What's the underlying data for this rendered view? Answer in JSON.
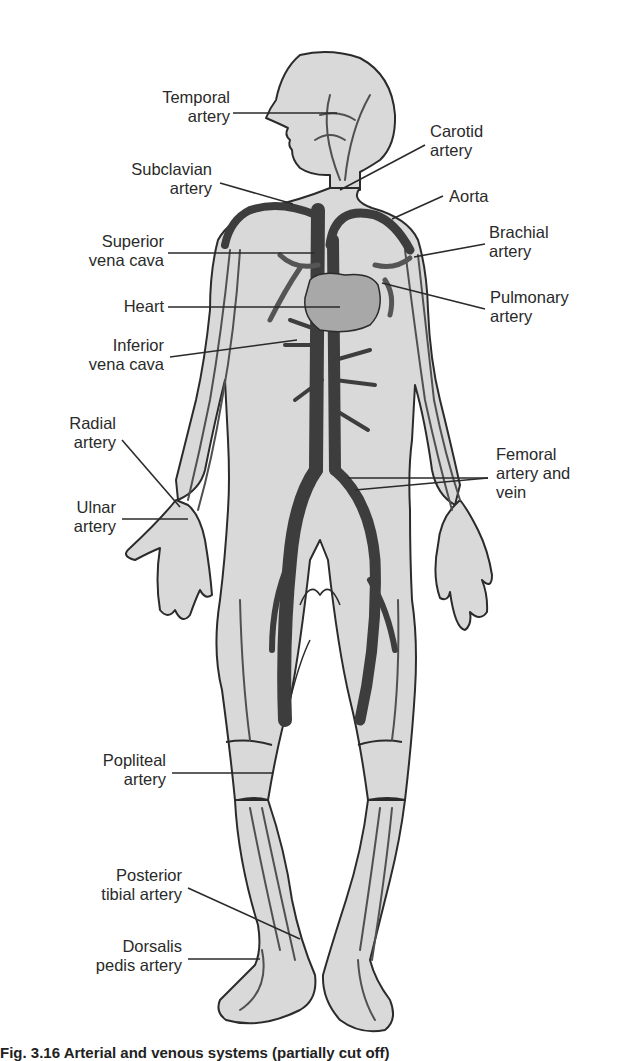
{
  "figure": {
    "colors": {
      "background": "#ffffff",
      "body_fill": "#d9d9d9",
      "outline": "#2b2b2b",
      "vessel_dark": "#3d3d3d",
      "vessel_mid": "#5a5a5a",
      "heart_fill": "#a8a8a8",
      "label_text": "#2a2a2a"
    },
    "labels_left": [
      {
        "id": "temporal-artery",
        "line1": "Temporal",
        "line2": "artery"
      },
      {
        "id": "subclavian-artery",
        "line1": "Subclavian",
        "line2": "artery"
      },
      {
        "id": "superior-vena-cava",
        "line1": "Superior",
        "line2": "vena cava"
      },
      {
        "id": "heart",
        "line1": "Heart",
        "line2": ""
      },
      {
        "id": "inferior-vena-cava",
        "line1": "Inferior",
        "line2": "vena cava"
      },
      {
        "id": "radial-artery",
        "line1": "Radial",
        "line2": "artery"
      },
      {
        "id": "ulnar-artery",
        "line1": "Ulnar",
        "line2": "artery"
      },
      {
        "id": "popliteal-artery",
        "line1": "Popliteal",
        "line2": "artery"
      },
      {
        "id": "posterior-tibial-artery",
        "line1": "Posterior",
        "line2": "tibial artery"
      },
      {
        "id": "dorsalis-pedis-artery",
        "line1": "Dorsalis",
        "line2": "pedis artery"
      }
    ],
    "labels_right": [
      {
        "id": "carotid-artery",
        "line1": "Carotid",
        "line2": "artery",
        "line3": ""
      },
      {
        "id": "aorta",
        "line1": "Aorta",
        "line2": "",
        "line3": ""
      },
      {
        "id": "brachial-artery",
        "line1": "Brachial",
        "line2": "artery",
        "line3": ""
      },
      {
        "id": "pulmonary-artery",
        "line1": "Pulmonary",
        "line2": "artery",
        "line3": ""
      },
      {
        "id": "femoral-artery-and-vein",
        "line1": "Femoral",
        "line2": "artery and",
        "line3": "vein"
      }
    ],
    "caption": "Fig. 3.16 Arterial and venous systems (partially cut off)"
  }
}
